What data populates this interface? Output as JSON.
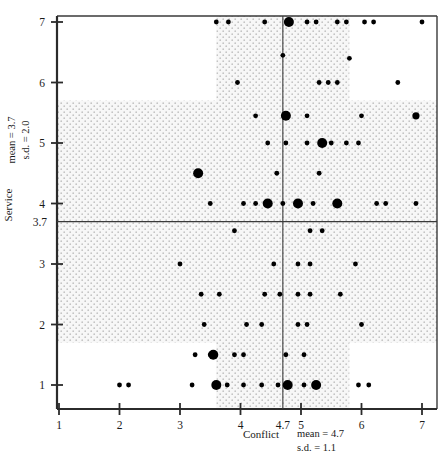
{
  "chart_data": {
    "type": "scatter",
    "title": "",
    "subtitle": "",
    "xlabel": "Conflict",
    "ylabel": "Service",
    "xlim": [
      0.6,
      7.4
    ],
    "ylim": [
      0.6,
      7.4
    ],
    "grid": false,
    "legend": null,
    "x_ticks": [
      1,
      2,
      3,
      4,
      5,
      6,
      7
    ],
    "x_tick_labels": [
      "1",
      "2",
      "3",
      "4",
      "5",
      "6",
      "7"
    ],
    "y_ticks": [
      1,
      2,
      3,
      4,
      5,
      6,
      7
    ],
    "y_tick_labels": [
      "1",
      "2",
      "3",
      "4",
      "5",
      "6",
      "7"
    ],
    "x_mean_tick_label": "4.7",
    "y_mean_tick_label": "3.7",
    "x_stats": {
      "mean_label": "mean  =  4.7",
      "sd_label": "s.d.  =  1.1",
      "mean": 4.7,
      "sd": 1.1
    },
    "y_stats": {
      "mean_label": "mean  =  3.7",
      "sd_label": "s.d.  =  2.0",
      "mean": 3.7,
      "sd": 2.0
    },
    "shaded_band_x": [
      3.6,
      5.8
    ],
    "shaded_band_y": [
      1.7,
      5.7
    ],
    "marker_color": "#000000",
    "axis_color": "#2b2b2b",
    "band_fill": "#efefef",
    "band_dot_color": "#b9b9b9",
    "marker_size_legend": {
      "small": "1 observation",
      "medium": "2 observations",
      "large": "3 or more observations"
    },
    "points": [
      {
        "x": 6.2,
        "y": 7.0,
        "n": 1
      },
      {
        "x": 7.0,
        "y": 7.0,
        "n": 1
      },
      {
        "x": 3.6,
        "y": 7.0,
        "n": 1
      },
      {
        "x": 3.8,
        "y": 7.0,
        "n": 1
      },
      {
        "x": 4.4,
        "y": 7.0,
        "n": 1
      },
      {
        "x": 4.8,
        "y": 7.0,
        "n": 3
      },
      {
        "x": 5.1,
        "y": 7.0,
        "n": 1
      },
      {
        "x": 5.25,
        "y": 7.0,
        "n": 1
      },
      {
        "x": 5.6,
        "y": 7.0,
        "n": 1
      },
      {
        "x": 5.75,
        "y": 7.0,
        "n": 1
      },
      {
        "x": 6.05,
        "y": 7.0,
        "n": 1
      },
      {
        "x": 4.7,
        "y": 6.45,
        "n": 1
      },
      {
        "x": 5.8,
        "y": 6.4,
        "n": 1
      },
      {
        "x": 6.6,
        "y": 6.0,
        "n": 1
      },
      {
        "x": 3.95,
        "y": 6.0,
        "n": 1
      },
      {
        "x": 5.3,
        "y": 6.0,
        "n": 1
      },
      {
        "x": 5.45,
        "y": 6.0,
        "n": 1
      },
      {
        "x": 5.6,
        "y": 6.0,
        "n": 1
      },
      {
        "x": 6.9,
        "y": 5.45,
        "n": 2
      },
      {
        "x": 4.25,
        "y": 5.45,
        "n": 1
      },
      {
        "x": 4.75,
        "y": 5.45,
        "n": 3
      },
      {
        "x": 5.1,
        "y": 5.45,
        "n": 1
      },
      {
        "x": 6.0,
        "y": 5.45,
        "n": 1
      },
      {
        "x": 4.45,
        "y": 5.0,
        "n": 1
      },
      {
        "x": 4.75,
        "y": 5.0,
        "n": 1
      },
      {
        "x": 5.1,
        "y": 5.0,
        "n": 1
      },
      {
        "x": 5.35,
        "y": 5.0,
        "n": 3
      },
      {
        "x": 5.5,
        "y": 5.0,
        "n": 1
      },
      {
        "x": 5.75,
        "y": 5.0,
        "n": 1
      },
      {
        "x": 5.95,
        "y": 5.0,
        "n": 1
      },
      {
        "x": 3.3,
        "y": 4.5,
        "n": 3
      },
      {
        "x": 4.6,
        "y": 4.5,
        "n": 1
      },
      {
        "x": 5.3,
        "y": 4.5,
        "n": 1
      },
      {
        "x": 6.9,
        "y": 4.0,
        "n": 1
      },
      {
        "x": 3.5,
        "y": 4.0,
        "n": 1
      },
      {
        "x": 4.05,
        "y": 4.0,
        "n": 1
      },
      {
        "x": 4.25,
        "y": 4.0,
        "n": 1
      },
      {
        "x": 4.45,
        "y": 4.0,
        "n": 3
      },
      {
        "x": 4.7,
        "y": 4.0,
        "n": 1
      },
      {
        "x": 4.95,
        "y": 4.0,
        "n": 3
      },
      {
        "x": 5.2,
        "y": 4.0,
        "n": 1
      },
      {
        "x": 5.6,
        "y": 4.0,
        "n": 3
      },
      {
        "x": 6.25,
        "y": 4.0,
        "n": 1
      },
      {
        "x": 6.4,
        "y": 4.0,
        "n": 1
      },
      {
        "x": 3.9,
        "y": 3.55,
        "n": 1
      },
      {
        "x": 5.15,
        "y": 3.55,
        "n": 1
      },
      {
        "x": 5.35,
        "y": 3.55,
        "n": 1
      },
      {
        "x": 3.0,
        "y": 3.0,
        "n": 1
      },
      {
        "x": 4.55,
        "y": 3.0,
        "n": 1
      },
      {
        "x": 4.95,
        "y": 3.0,
        "n": 1
      },
      {
        "x": 5.15,
        "y": 3.0,
        "n": 1
      },
      {
        "x": 5.9,
        "y": 3.0,
        "n": 1
      },
      {
        "x": 3.35,
        "y": 2.5,
        "n": 1
      },
      {
        "x": 3.65,
        "y": 2.5,
        "n": 1
      },
      {
        "x": 4.4,
        "y": 2.5,
        "n": 1
      },
      {
        "x": 4.65,
        "y": 2.5,
        "n": 1
      },
      {
        "x": 4.95,
        "y": 2.5,
        "n": 1
      },
      {
        "x": 5.15,
        "y": 2.5,
        "n": 1
      },
      {
        "x": 5.65,
        "y": 2.5,
        "n": 1
      },
      {
        "x": 3.4,
        "y": 2.0,
        "n": 1
      },
      {
        "x": 4.1,
        "y": 2.0,
        "n": 1
      },
      {
        "x": 4.35,
        "y": 2.0,
        "n": 1
      },
      {
        "x": 4.95,
        "y": 2.0,
        "n": 1
      },
      {
        "x": 5.1,
        "y": 2.0,
        "n": 1
      },
      {
        "x": 6.0,
        "y": 2.0,
        "n": 1
      },
      {
        "x": 3.9,
        "y": 1.5,
        "n": 1
      },
      {
        "x": 4.05,
        "y": 1.5,
        "n": 1
      },
      {
        "x": 4.75,
        "y": 1.5,
        "n": 1
      },
      {
        "x": 5.05,
        "y": 1.5,
        "n": 1
      },
      {
        "x": 3.25,
        "y": 1.5,
        "n": 1
      },
      {
        "x": 3.5,
        "y": 1.5,
        "n": 1
      },
      {
        "x": 3.55,
        "y": 1.5,
        "n": 3
      },
      {
        "x": 2.0,
        "y": 1.0,
        "n": 1
      },
      {
        "x": 2.15,
        "y": 1.0,
        "n": 1
      },
      {
        "x": 3.2,
        "y": 1.0,
        "n": 1
      },
      {
        "x": 3.6,
        "y": 1.0,
        "n": 3
      },
      {
        "x": 3.78,
        "y": 1.0,
        "n": 1
      },
      {
        "x": 4.05,
        "y": 1.0,
        "n": 1
      },
      {
        "x": 4.35,
        "y": 1.0,
        "n": 1
      },
      {
        "x": 4.62,
        "y": 1.0,
        "n": 1
      },
      {
        "x": 4.78,
        "y": 1.0,
        "n": 3
      },
      {
        "x": 5.05,
        "y": 1.0,
        "n": 1
      },
      {
        "x": 5.25,
        "y": 1.0,
        "n": 3
      },
      {
        "x": 5.95,
        "y": 1.0,
        "n": 1
      },
      {
        "x": 6.12,
        "y": 1.0,
        "n": 1
      }
    ]
  }
}
